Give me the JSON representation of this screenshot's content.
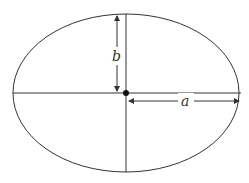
{
  "diagram": {
    "type": "ellipse",
    "labels": {
      "semi_minor": "b",
      "semi_major": "a"
    },
    "colors": {
      "stroke": "#333333",
      "center_point": "#111111"
    }
  }
}
